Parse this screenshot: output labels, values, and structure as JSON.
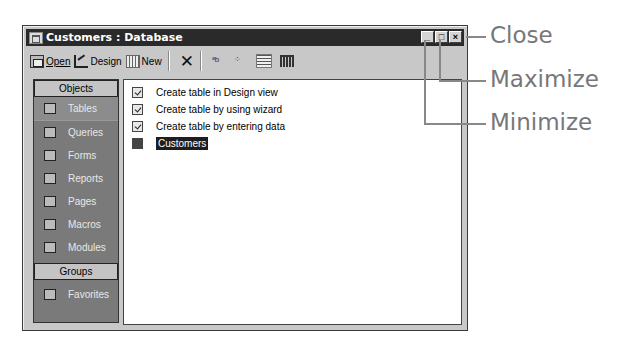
{
  "window": {
    "title": "Customers : Database",
    "controls": {
      "minimize": "_",
      "maximize": "□",
      "close": "×"
    }
  },
  "toolbar": {
    "open_label": "Open",
    "design_label": "Design",
    "new_label": "New",
    "delete_symbol": "✕",
    "large_icons_symbol": "ᵃb",
    "small_icons_symbol": "⁘",
    "list_symbol": "",
    "details_symbol": ""
  },
  "sidebar": {
    "objects_header": "Objects",
    "items": [
      {
        "label": "Tables",
        "icon": "table-icon",
        "selected": true
      },
      {
        "label": "Queries",
        "icon": "query-icon"
      },
      {
        "label": "Forms",
        "icon": "form-icon"
      },
      {
        "label": "Reports",
        "icon": "report-icon"
      },
      {
        "label": "Pages",
        "icon": "page-icon"
      },
      {
        "label": "Macros",
        "icon": "macro-icon"
      },
      {
        "label": "Modules",
        "icon": "module-icon"
      }
    ],
    "groups_header": "Groups",
    "groups": [
      {
        "label": "Favorites",
        "icon": "favorites-folder-icon"
      }
    ]
  },
  "list": {
    "items": [
      {
        "label": "Create table in Design view",
        "icon": "shortcut-icon"
      },
      {
        "label": "Create table by using wizard",
        "icon": "shortcut-icon"
      },
      {
        "label": "Create table by entering data",
        "icon": "shortcut-icon"
      },
      {
        "label": "Customers",
        "icon": "table-icon",
        "selected": true
      }
    ]
  },
  "callouts": {
    "close": "Close",
    "maximize": "Maximize",
    "minimize": "Minimize"
  }
}
